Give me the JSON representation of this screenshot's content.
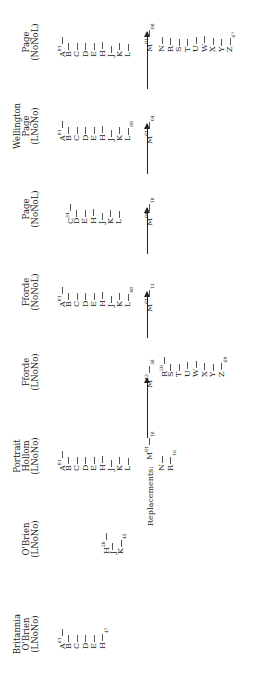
{
  "diagram": {
    "replacements_label": "Replacements:",
    "columns": [
      {
        "header": [
          "Britannia",
          "O'Brien",
          "(LNoNo)"
        ],
        "entries": [
          {
            "letter": "A",
            "sup": "61",
            "style": "left"
          },
          {
            "letter": "B",
            "style": "left"
          },
          {
            "letter": "C",
            "style": "left"
          },
          {
            "letter": "D",
            "style": "left"
          },
          {
            "letter": "E",
            "style": "left"
          },
          {
            "letter": "H",
            "sub": "47",
            "style": "left"
          }
        ]
      },
      {
        "header": [
          "O'Brien",
          "(LNoNo)"
        ],
        "entries": [
          {
            "letter": "H",
            "sup": "20",
            "style": "left"
          },
          {
            "letter": "J",
            "style": "left"
          },
          {
            "letter": "K",
            "sub": "45",
            "style": "left"
          }
        ]
      },
      {
        "header": [
          "Portrait",
          "Hollom",
          "(LNoNo)"
        ],
        "entries": [
          {
            "letter": "A",
            "sup": "01"
          },
          {
            "letter": "B"
          },
          {
            "letter": "C"
          },
          {
            "letter": "D"
          },
          {
            "letter": "E"
          },
          {
            "letter": "H"
          },
          {
            "letter": "J"
          },
          {
            "letter": "K"
          },
          {
            "letter": "L"
          }
        ],
        "m": {
          "letter": "M",
          "sup": "01",
          "sub": "18"
        },
        "tail": [
          {
            "letter": "N"
          },
          {
            "letter": "R",
            "sub": "16"
          }
        ]
      },
      {
        "header": [
          "Fforde",
          "(LNoNo)"
        ],
        "entries": [],
        "m": {
          "letter": "M",
          "sup": "13",
          "sub": "38"
        },
        "tail": [
          {
            "letter": "R",
            "sup": "20"
          },
          {
            "letter": "S"
          },
          {
            "letter": "T"
          },
          {
            "letter": "U"
          },
          {
            "letter": "W"
          },
          {
            "letter": "X"
          },
          {
            "letter": "Y"
          },
          {
            "letter": "Z",
            "sub": "69"
          }
        ]
      },
      {
        "header": [
          "Fforde",
          "(NoNoL)"
        ],
        "entries": [
          {
            "letter": "A",
            "sup": "01"
          },
          {
            "letter": "B"
          },
          {
            "letter": "C"
          },
          {
            "letter": "D"
          },
          {
            "letter": "E"
          },
          {
            "letter": "H"
          },
          {
            "letter": "J"
          },
          {
            "letter": "K"
          },
          {
            "letter": "L",
            "sub": "40"
          }
        ],
        "m": {
          "letter": "M",
          "sup": "01",
          "sub": "13"
        }
      },
      {
        "header": [
          "Page",
          "(NoNoL)"
        ],
        "entries": [
          {
            "letter": "C",
            "sup": "34"
          },
          {
            "letter": "D"
          },
          {
            "letter": "E"
          },
          {
            "letter": "H"
          },
          {
            "letter": "J"
          },
          {
            "letter": "K"
          },
          {
            "letter": "L"
          }
        ],
        "m": {
          "letter": "M",
          "sup": "04",
          "sub": "10"
        }
      },
      {
        "header": [
          "Wellington",
          "Page",
          "(LNoNo)"
        ],
        "entries": [
          {
            "letter": "A",
            "sup": "01"
          },
          {
            "letter": "B"
          },
          {
            "letter": "C"
          },
          {
            "letter": "D"
          },
          {
            "letter": "E"
          },
          {
            "letter": "H"
          },
          {
            "letter": "J"
          },
          {
            "letter": "K"
          },
          {
            "letter": "L",
            "sub": "60"
          }
        ],
        "m": {
          "letter": "M",
          "sup": "01",
          "sub": "04"
        }
      },
      {
        "header": [
          "Page",
          "(NoNoL)"
        ],
        "entries": [
          {
            "letter": "A",
            "sup": "01"
          },
          {
            "letter": "B"
          },
          {
            "letter": "C"
          },
          {
            "letter": "D"
          },
          {
            "letter": "E"
          },
          {
            "letter": "H"
          },
          {
            "letter": "J"
          },
          {
            "letter": "K"
          },
          {
            "letter": "L"
          }
        ],
        "m": {
          "letter": "M",
          "sup": "01",
          "sub": "08"
        },
        "tail": [
          {
            "letter": "N"
          },
          {
            "letter": "R"
          },
          {
            "letter": "S"
          },
          {
            "letter": "T"
          },
          {
            "letter": "U"
          },
          {
            "letter": "W"
          },
          {
            "letter": "X"
          },
          {
            "letter": "Y"
          },
          {
            "letter": "Z",
            "sub": "67"
          }
        ]
      }
    ]
  }
}
